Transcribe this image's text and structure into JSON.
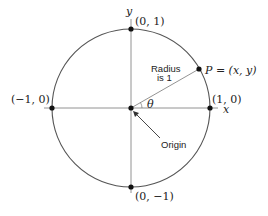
{
  "diagram": {
    "axes": {
      "x_label": "x",
      "y_label": "y"
    },
    "points": {
      "top": "(0, 1)",
      "bottom": "(0, −1)",
      "left": "(−1, 0)",
      "right": "(1, 0)",
      "p": "P = (x, y)"
    },
    "angle_label": "θ",
    "radius_label_line1": "Radius",
    "radius_label_line2": "is 1",
    "origin_label": "Origin"
  },
  "colors": {
    "line": "#555555",
    "dot": "#111111",
    "text": "#222222"
  }
}
